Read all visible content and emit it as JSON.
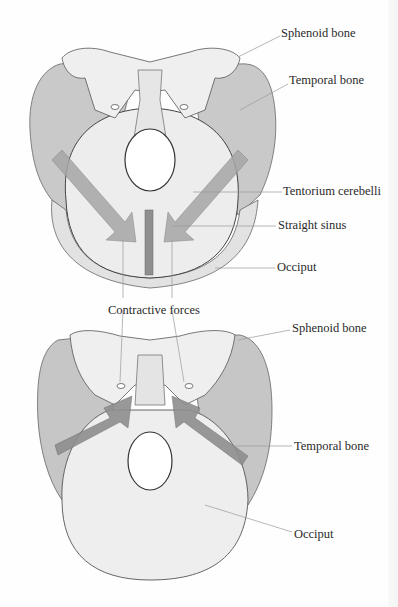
{
  "figure": {
    "top_panel": {
      "labels": [
        {
          "id": "sphenoid",
          "text": "Sphenoid bone",
          "x": 281,
          "y": 27
        },
        {
          "id": "temporal",
          "text": "Temporal bone",
          "x": 289,
          "y": 74
        },
        {
          "id": "tentorium",
          "text": "Tentorium cerebelli",
          "x": 283,
          "y": 185
        },
        {
          "id": "straight-sinus",
          "text": "Straight sinus",
          "x": 278,
          "y": 219
        },
        {
          "id": "occiput",
          "text": "Occiput",
          "x": 277,
          "y": 261
        }
      ]
    },
    "center_label": {
      "text": "Contractive forces",
      "x": 108,
      "y": 304
    },
    "bottom_panel": {
      "labels": [
        {
          "id": "sphenoid",
          "text": "Sphenoid bone",
          "x": 292,
          "y": 322
        },
        {
          "id": "temporal",
          "text": "Temporal bone",
          "x": 294,
          "y": 440
        },
        {
          "id": "occiput",
          "text": "Occiput",
          "x": 294,
          "y": 528
        }
      ]
    },
    "colors": {
      "bone_light": "#ececec",
      "bone_mid": "#c9c9c9",
      "bone_dark": "#a9a9a9",
      "arrow": "#9c9c9c",
      "sinus": "#8f8f8f",
      "outline": "#555555",
      "leader": "#9a9a9a",
      "text": "#2a2a2a"
    }
  }
}
